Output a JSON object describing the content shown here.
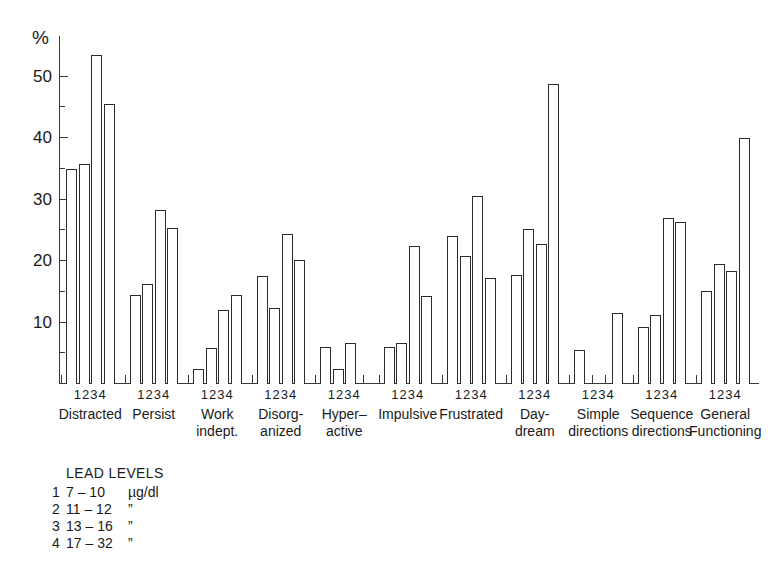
{
  "chart_data": {
    "type": "bar",
    "title": "",
    "xlabel": "",
    "ylabel": "%",
    "ylim": [
      0,
      55
    ],
    "yticks_major": [
      10,
      20,
      30,
      40,
      50
    ],
    "yticks_minor": [
      5,
      15,
      25,
      35,
      45
    ],
    "grid": false,
    "legend_position": "below-left",
    "group_tick_labels": [
      "1",
      "2",
      "3",
      "4"
    ],
    "categories": [
      "Distracted",
      "Persist",
      "Work indept.",
      "Disorganized",
      "Hyper-active",
      "Impulsive",
      "Frustrated",
      "Day-dream",
      "Simple directions",
      "Sequence directions",
      "General Functioning"
    ],
    "category_lines": [
      [
        "Distracted"
      ],
      [
        "Persist"
      ],
      [
        "Work",
        "indept."
      ],
      [
        "Disorg-",
        "anized"
      ],
      [
        "Hyper–",
        "active"
      ],
      [
        "Impulsive"
      ],
      [
        "Frustrated"
      ],
      [
        "Day-",
        "dream"
      ],
      [
        "Simple",
        "directions"
      ],
      [
        "Sequence",
        "directions"
      ],
      [
        "General",
        "Functioning"
      ]
    ],
    "series": [
      {
        "name": "1",
        "lead_level": "7 – 10 µg/dl",
        "values": [
          35.0,
          14.5,
          2.5,
          17.6,
          6.0,
          6.0,
          24.0,
          17.8,
          5.5,
          9.3,
          15.2
        ]
      },
      {
        "name": "2",
        "lead_level": "11 – 12",
        "values": [
          35.7,
          16.3,
          5.8,
          12.4,
          2.5,
          6.7,
          20.8,
          25.2,
          0.0,
          11.2,
          19.5
        ]
      },
      {
        "name": "3",
        "lead_level": "13 – 16",
        "values": [
          53.5,
          28.3,
          12.0,
          24.4,
          6.7,
          22.5,
          30.6,
          22.8,
          0.0,
          27.0,
          18.3
        ]
      },
      {
        "name": "4",
        "lead_level": "17 – 32",
        "values": [
          45.5,
          25.3,
          14.5,
          20.2,
          0.0,
          14.3,
          17.2,
          48.8,
          11.5,
          26.3,
          40.0
        ]
      }
    ]
  },
  "legend": {
    "title": "LEAD LEVELS",
    "rows": [
      {
        "key": "1",
        "range": "7 – 10",
        "unit": "µg/dl"
      },
      {
        "key": "2",
        "range": "11 – 12",
        "unit": "”"
      },
      {
        "key": "3",
        "range": "13 – 16",
        "unit": "”"
      },
      {
        "key": "4",
        "range": "17 – 32",
        "unit": "”"
      }
    ]
  },
  "colors": {
    "bar_outline": "#2b2b2b",
    "bar_fill": "#ffffff",
    "axis": "#3a3a3a",
    "text": "#1a1a1a",
    "background": "#ffffff"
  }
}
